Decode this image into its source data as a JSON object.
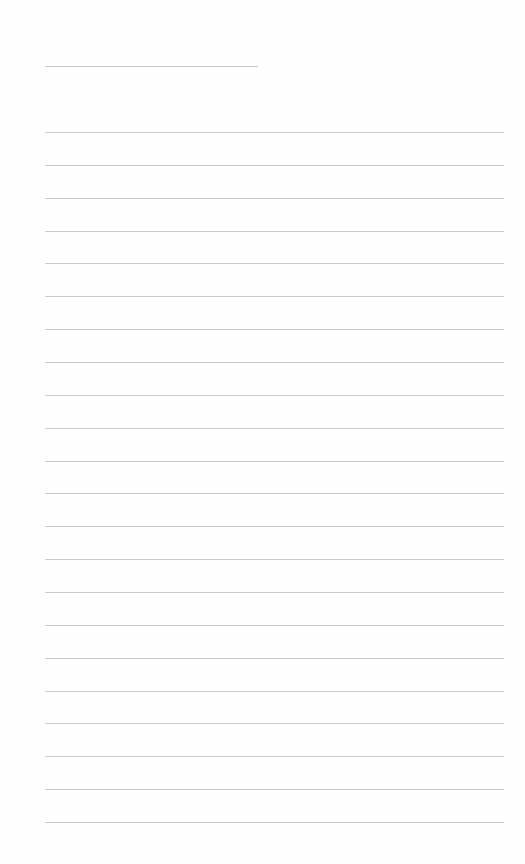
{
  "page": {
    "type": "lined-paper",
    "background_color": "#fefefe",
    "line_color": "#c9c9c9",
    "header_line": {
      "y": 66,
      "left": 45,
      "right": 258
    },
    "ruled_lines": {
      "count": 22,
      "first_y": 132,
      "spacing": 32.86,
      "left": 45,
      "right": 504
    }
  }
}
